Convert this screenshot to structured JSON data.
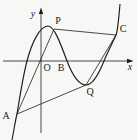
{
  "figure": {
    "type": "function-sketch",
    "labels": {
      "origin": "O",
      "x_axis": "x",
      "y_axis": "y",
      "point_a": "A",
      "point_b": "B",
      "point_c": "C",
      "point_p": "P",
      "point_q": "Q"
    },
    "elements": {
      "curve": "cubic function curve",
      "segments": [
        "AP",
        "PC",
        "CQ",
        "QA"
      ]
    },
    "colors": {
      "stroke": "#1c1c1c",
      "background": "#f7f7f5"
    }
  }
}
